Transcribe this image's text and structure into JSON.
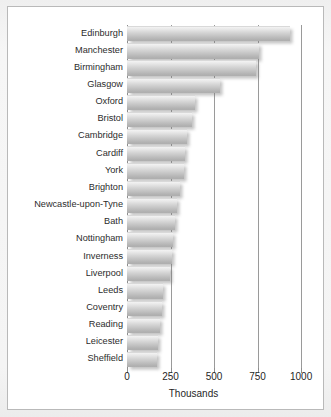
{
  "chart_data": {
    "type": "bar",
    "orientation": "horizontal",
    "title": "",
    "subtitle": "",
    "xlabel": "Thousands",
    "ylabel": "",
    "xlim": [
      0,
      1005
    ],
    "xticks": [
      0,
      250,
      500,
      750,
      1000
    ],
    "xtick_labels": [
      "0",
      "250",
      "500",
      "750",
      "1000"
    ],
    "grid": true,
    "grid_axis": "x",
    "legend": false,
    "legend_position": "none",
    "bar_color": "#c9c9c9",
    "categories": [
      "Edinburgh",
      "Manchester",
      "Birmingham",
      "Glasgow",
      "Oxford",
      "Bristol",
      "Cambridge",
      "Cardiff",
      "York",
      "Brighton",
      "Newcastle-upon-Tyne",
      "Bath",
      "Nottingham",
      "Inverness",
      "Liverpool",
      "Leeds",
      "Coventry",
      "Reading",
      "Leicester",
      "Sheffield"
    ],
    "values": [
      935,
      760,
      740,
      535,
      390,
      372,
      345,
      333,
      330,
      305,
      290,
      276,
      265,
      257,
      248,
      207,
      200,
      190,
      180,
      172
    ]
  },
  "figure": {
    "background_color": "#f2f2f2",
    "panel_color": "#ffffff",
    "border_color": "#b9b9b9",
    "axis_color": "#8e8e8e"
  }
}
